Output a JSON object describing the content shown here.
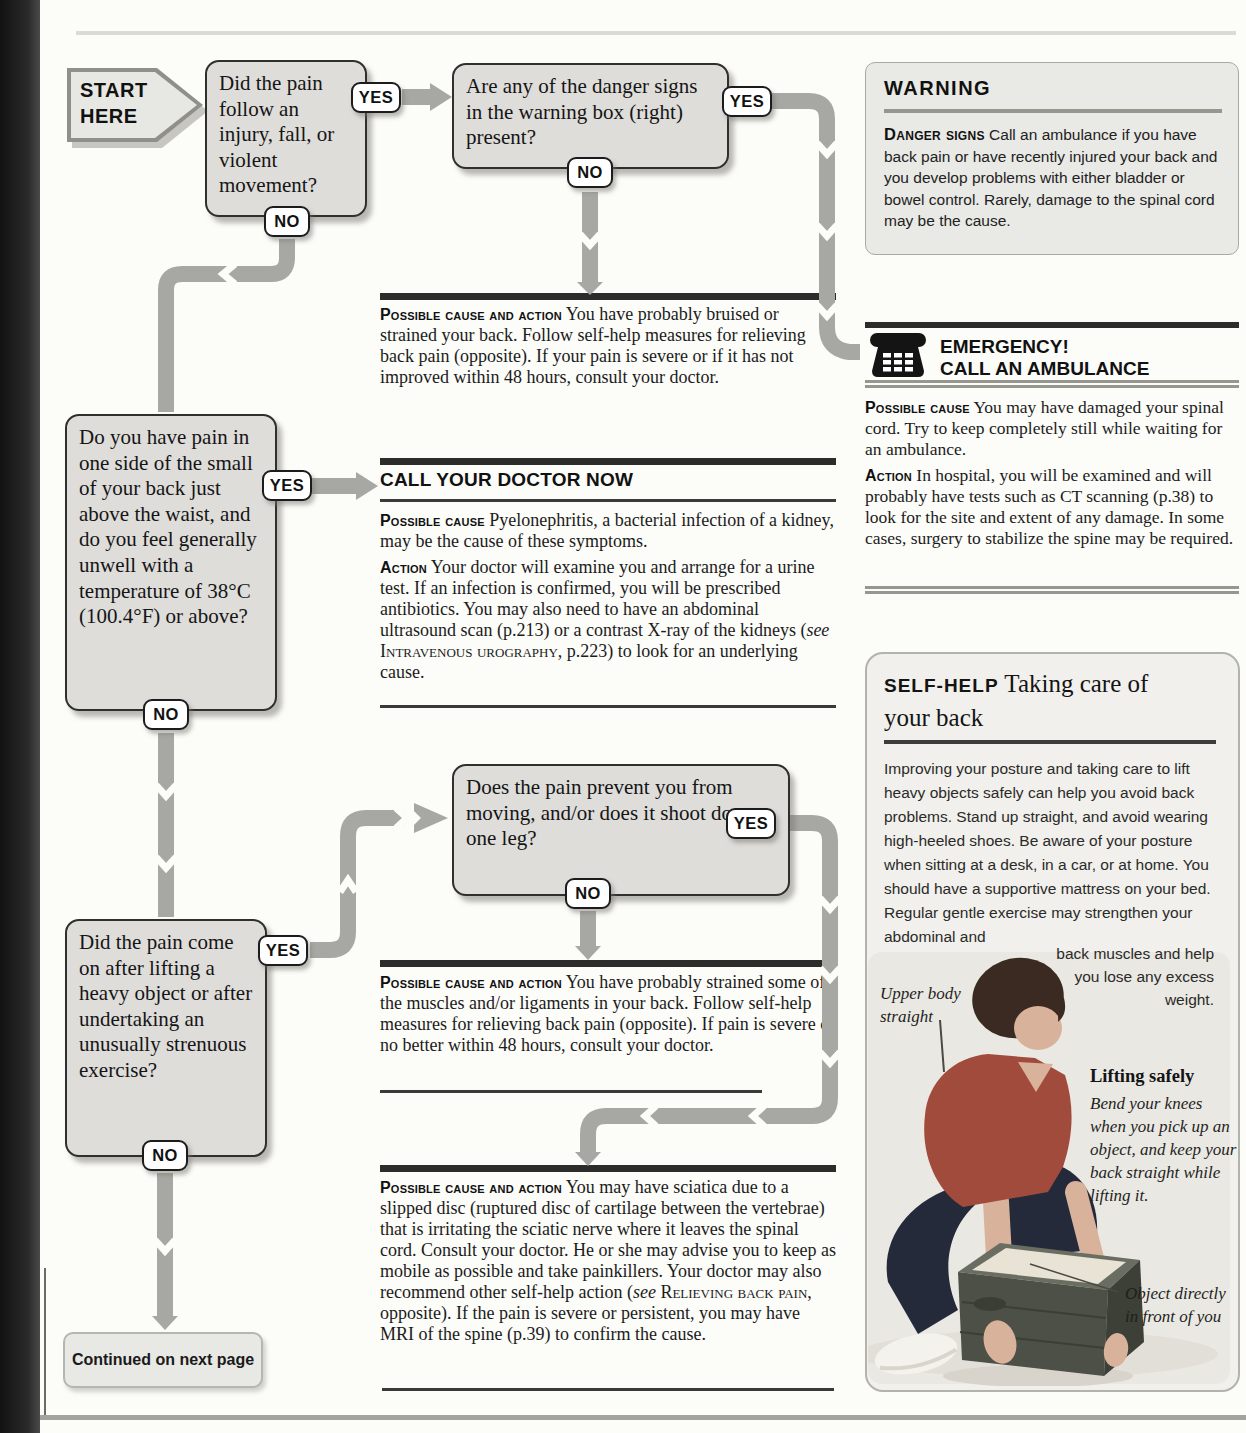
{
  "flow": {
    "start": "START HERE",
    "yes": "YES",
    "no": "NO",
    "q1": "Did the pain follow an injury, fall, or violent movement?",
    "q2": "Are any of the danger signs in the warning box (right) present?",
    "q3": "Do you have pain in one side of the small of your back just above the waist, and do you feel generally unwell with a temperature of 38°C (100.4°F) or above?",
    "q4": "Did the pain come on after lifting a heavy object or after undertaking an unusually strenuous exercise?",
    "q5": "Does the pain prevent you from moving, and/or does it shoot down one leg?",
    "continued": "Continued on next page"
  },
  "result_bruised": {
    "label": "Possible cause and action",
    "text": " You have probably bruised or strained your back. Follow self-help measures for relieving back pain (opposite). If your pain is severe or if it has not improved within 48 hours, consult your doctor."
  },
  "call_doctor": {
    "heading": "CALL YOUR DOCTOR NOW",
    "cause_label": "Possible cause",
    "cause_text": " Pyelonephritis, a bacterial infection of a kidney, may be the cause of these symptoms.",
    "action_label": "Action",
    "action_pre": " Your doctor will examine you and arrange for a urine test. If an infection is confirmed, you will be prescribed antibiotics. You may also need to have an abdominal ultrasound scan (p.213) or a contrast X-ray of the kidneys (",
    "action_see": "see",
    "action_ref": " Intravenous urography",
    "action_post": ", p.223) to look for an underlying cause."
  },
  "result_strained": {
    "label": "Possible cause and action",
    "text": " You have probably strained some of the muscles and/or ligaments in your back. Follow self-help measures for relieving back pain (opposite). If pain is severe or no better within 48 hours, consult your doctor."
  },
  "result_sciatica": {
    "label": "Possible cause and action",
    "pre": " You may have sciatica due to a slipped disc (ruptured disc of cartilage between the vertebrae) that is irritating the sciatic nerve where it leaves the spinal cord. Consult your doctor. He or she may advise you to keep as mobile as possible and take painkillers. Your doctor may also recommend other self-help action (",
    "see": "see",
    "ref": " Relieving back pain",
    "post": ", opposite). If the pain is severe or persistent, you may have MRI of the spine (p.39) to confirm the cause."
  },
  "warning": {
    "title": "WARNING",
    "signs_label": "Danger signs",
    "body": " Call an ambulance if you have back pain or have recently injured your back and you develop problems with either bladder or bowel control. Rarely, damage to the spinal cord may be the cause."
  },
  "emergency": {
    "title_1": "EMERGENCY!",
    "title_2": "CALL AN AMBULANCE",
    "cause_label": "Possible cause",
    "cause_text": " You may have damaged your spinal cord. Try to keep completely still while waiting for an ambulance.",
    "action_label": "Action",
    "action_text": " In hospital, you will be examined and will probably have tests such as CT scanning (p.38) to look for the site and extent of any damage. In some cases, surgery to stabilize the spine may be required."
  },
  "selfhelp": {
    "label": "SELF-HELP",
    "title": " Taking care of your back",
    "body": "Improving your posture and taking care to lift heavy objects safely can help you avoid back problems. Stand up straight, and avoid wearing high-heeled shoes. Be aware of your posture when sitting at a desk, in a car, or at home. You should have a supportive mattress on your bed. Regular gentle exercise may strengthen your abdominal and",
    "body_wrap": "back muscles and help you lose any excess weight.",
    "caption_upper": "Upper body straight",
    "caption_lift_title": "Lifting safely",
    "caption_lift_text": "Bend your knees when you pick up an object, and keep your back straight while lifting it.",
    "caption_object": "Object directly in front of you"
  }
}
